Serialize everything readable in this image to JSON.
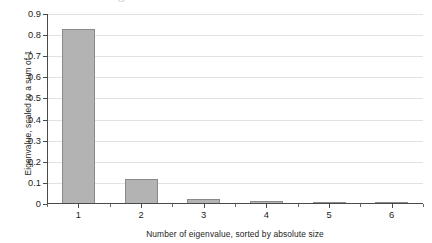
{
  "chart_data": {
    "type": "bar",
    "title": "",
    "subtitle": "",
    "xlabel": "Number of eigenvalue, sorted by absolute size",
    "ylabel": "Eigenvalue, scaled to a sum of 1",
    "categories": [
      "1",
      "2",
      "3",
      "4",
      "5",
      "6"
    ],
    "values": [
      0.83,
      0.118,
      0.022,
      0.012,
      0.007,
      0.004
    ],
    "series": [
      {
        "name": "Eigenvalue",
        "values": [
          0.83,
          0.118,
          0.022,
          0.012,
          0.007,
          0.004
        ]
      }
    ],
    "ylim": [
      0,
      0.9
    ],
    "xlim": [
      0,
      6
    ],
    "ytick_labels": [
      "0",
      "0.1",
      "0.2",
      "0.3",
      "0.4",
      "0.5",
      "0.6",
      "0.7",
      "0.8",
      "0.9"
    ],
    "ytick_values": [
      0,
      0.1,
      0.2,
      0.3,
      0.4,
      0.5,
      0.6,
      0.7,
      0.8,
      0.9
    ],
    "xtick_labels": [
      "1",
      "2",
      "3",
      "4",
      "5",
      "6"
    ],
    "grid": "horizontal",
    "legend": "none",
    "bar_fill_color": "#b3b3b3",
    "bar_edge_color": "#8a8a8a",
    "gridline_color": "#e2e2e2",
    "axis_color": "#4a4a4a",
    "background_color": "#ffffff"
  },
  "artifacts": {
    "ghost_descender": "g"
  }
}
